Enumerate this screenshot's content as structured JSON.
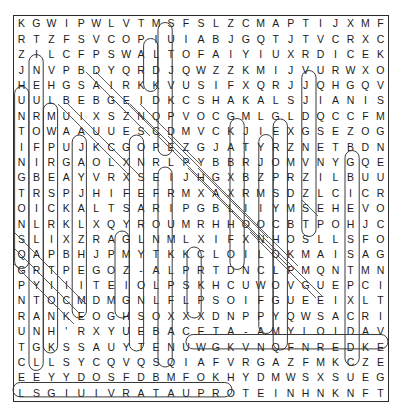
{
  "puzzle": {
    "type": "word-search",
    "rows": 23,
    "cols": 23,
    "grid": [
      [
        "K",
        "G",
        "W",
        "I",
        "P",
        "W",
        "L",
        "V",
        "T",
        "M",
        "S",
        "F",
        "S",
        "L",
        "Z",
        "C",
        "M",
        "A",
        "P",
        "T",
        "I",
        "J",
        "X",
        "M",
        "F"
      ],
      [
        "R",
        "T",
        "Z",
        "F",
        "S",
        "V",
        "C",
        "O",
        "P",
        "I",
        "U",
        "I",
        "A",
        "B",
        "J",
        "G",
        "Q",
        "T",
        "J",
        "T",
        "V",
        "C",
        "R",
        "X",
        "C"
      ],
      [
        "Z",
        "I",
        "L",
        "C",
        "F",
        "P",
        "S",
        "W",
        "A",
        "L",
        "T",
        "O",
        "F",
        "A",
        "I",
        "Y",
        "I",
        "U",
        "X",
        "R",
        "D",
        "I",
        "C",
        "E",
        "K"
      ],
      [
        "J",
        "N",
        "V",
        "P",
        "B",
        "D",
        "Y",
        "Q",
        "R",
        "D",
        "J",
        "Q",
        "W",
        "Z",
        "Z",
        "K",
        "M",
        "I",
        "J",
        "V",
        "U",
        "R",
        "W",
        "X",
        "O"
      ],
      [
        "H",
        "E",
        "H",
        "G",
        "S",
        "A",
        "I",
        "R",
        "K",
        "K",
        "V",
        "U",
        "S",
        "I",
        "F",
        "X",
        "Q",
        "R",
        "J",
        "J",
        "Q",
        "H",
        "G",
        "Q",
        "V"
      ],
      [
        "U",
        "U",
        "L",
        "B",
        "E",
        "B",
        "G",
        "E",
        "I",
        "D",
        "K",
        "C",
        "S",
        "H",
        "A",
        "K",
        "A",
        "L",
        "S",
        "J",
        "I",
        "A",
        "N",
        "I",
        "S"
      ],
      [
        "N",
        "R",
        "M",
        "U",
        "I",
        "X",
        "S",
        "Z",
        "N",
        "Q",
        "P",
        "V",
        "O",
        "C",
        "G",
        "M",
        "L",
        "G",
        "L",
        "D",
        "Q",
        "C",
        "C",
        "F",
        "M"
      ],
      [
        "T",
        "O",
        "W",
        "A",
        "A",
        "U",
        "U",
        "E",
        "S",
        "C",
        "D",
        "M",
        "V",
        "C",
        "K",
        "J",
        "I",
        "E",
        "X",
        "G",
        "S",
        "E",
        "Z",
        "O",
        "G"
      ],
      [
        "I",
        "F",
        "P",
        "U",
        "J",
        "K",
        "C",
        "G",
        "O",
        "P",
        "E",
        "Z",
        "G",
        "J",
        "A",
        "T",
        "Y",
        "R",
        "Z",
        "N",
        "E",
        "T",
        "B",
        "D",
        "N"
      ],
      [
        "N",
        "I",
        "R",
        "G",
        "A",
        "O",
        "L",
        "X",
        "N",
        "R",
        "L",
        "P",
        "Y",
        "B",
        "B",
        "R",
        "J",
        "O",
        "M",
        "V",
        "N",
        "Y",
        "G",
        "Q",
        "E"
      ],
      [
        "G",
        "B",
        "E",
        "A",
        "Y",
        "V",
        "R",
        "X",
        "S",
        "E",
        "I",
        "J",
        "H",
        "G",
        "X",
        "B",
        "Z",
        "P",
        "R",
        "Z",
        "I",
        "L",
        "B",
        "U",
        "U"
      ],
      [
        "T",
        "R",
        "S",
        "P",
        "J",
        "H",
        "I",
        "F",
        "E",
        "F",
        "R",
        "M",
        "X",
        "A",
        "X",
        "R",
        "M",
        "S",
        "D",
        "Z",
        "L",
        "C",
        "I",
        "C",
        "R"
      ],
      [
        "O",
        "I",
        "C",
        "K",
        "A",
        "L",
        "T",
        "S",
        "A",
        "R",
        "I",
        "P",
        "G",
        "B",
        "L",
        "I",
        "I",
        "Y",
        "M",
        "S",
        "E",
        "H",
        "E",
        "V",
        "O"
      ],
      [
        "N",
        "L",
        "R",
        "K",
        "L",
        "X",
        "Q",
        "Y",
        "R",
        "O",
        "U",
        "M",
        "R",
        "H",
        "H",
        "O",
        "O",
        "C",
        "B",
        "T",
        "P",
        "O",
        "H",
        "J",
        "C"
      ],
      [
        "S",
        "L",
        "I",
        "X",
        "Z",
        "R",
        "A",
        "G",
        "L",
        "N",
        "M",
        "L",
        "X",
        "I",
        "F",
        "X",
        "N",
        "H",
        "O",
        "S",
        "L",
        "L",
        "S",
        "F",
        "O"
      ],
      [
        "Q",
        "A",
        "P",
        "B",
        "H",
        "J",
        "P",
        "M",
        "Y",
        "T",
        "K",
        "K",
        "C",
        "L",
        "O",
        "I",
        "L",
        "O",
        "K",
        "M",
        "A",
        "I",
        "S",
        "A",
        "G"
      ],
      [
        "G",
        "R",
        "T",
        "P",
        "E",
        "G",
        "O",
        "Z",
        "-",
        "A",
        "L",
        "P",
        "R",
        "T",
        "D",
        "N",
        "C",
        "L",
        "P",
        "M",
        "Q",
        "N",
        "T",
        "M",
        "N"
      ],
      [
        "P",
        "Y",
        "I",
        "I",
        "I",
        "T",
        "E",
        "I",
        "O",
        "L",
        "P",
        "S",
        "K",
        "H",
        "C",
        "U",
        "W",
        "O",
        "V",
        "G",
        "U",
        "E",
        "P",
        "C",
        "I"
      ],
      [
        "N",
        "T",
        "O",
        "C",
        "M",
        "D",
        "M",
        "G",
        "N",
        "L",
        "F",
        "L",
        "P",
        "S",
        "O",
        "I",
        "F",
        "G",
        "U",
        "E",
        "E",
        "I",
        "X",
        "L",
        "T"
      ],
      [
        "R",
        "A",
        "N",
        "K",
        "E",
        "O",
        "G",
        "H",
        "S",
        "O",
        "X",
        "X",
        "X",
        "D",
        "N",
        "P",
        "P",
        "Y",
        "Q",
        "W",
        "S",
        "A",
        "C",
        "R",
        "I"
      ],
      [
        "U",
        "N",
        "H",
        "'",
        "R",
        "X",
        "Y",
        "U",
        "E",
        "B",
        "A",
        "C",
        "E",
        "T",
        "A",
        "-",
        "A",
        "M",
        "Y",
        "L",
        "O",
        "I",
        "D",
        "A",
        "V"
      ],
      [
        "T",
        "G",
        "K",
        "S",
        "S",
        "A",
        "U",
        "Y",
        "T",
        "E",
        "N",
        "U",
        "W",
        "G",
        "K",
        "V",
        "N",
        "Q",
        "F",
        "N",
        "R",
        "E",
        "D",
        "K",
        "E"
      ],
      [
        "C",
        "L",
        "L",
        "S",
        "Y",
        "C",
        "Q",
        "V",
        "Q",
        "S",
        "Q",
        "I",
        "A",
        "F",
        "V",
        "R",
        "G",
        "A",
        "Z",
        "F",
        "M",
        "K",
        "C",
        "Z",
        "E"
      ],
      [
        "E",
        "E",
        "Y",
        "Y",
        "D",
        "O",
        "S",
        "F",
        "D",
        "B",
        "M",
        "F",
        "O",
        "K",
        "H",
        "Y",
        "D",
        "M",
        "W",
        "S",
        "X",
        "S",
        "U",
        "E",
        "G"
      ],
      [
        "L",
        "S",
        "G",
        "I",
        "U",
        "I",
        "V",
        "R",
        "A",
        "T",
        "A",
        "U",
        "P",
        "R",
        "O",
        "T",
        "E",
        "I",
        "N",
        "H",
        "N",
        "K",
        "N",
        "F",
        "T"
      ]
    ],
    "found_words": [
      "BETA-AMYLOID",
      "TAU PROTEIN"
    ],
    "visible_answer_strings": {
      "beta_amyloid": "BETA - AMYLOID",
      "tau_protein": "TAU PROTEIN"
    }
  }
}
